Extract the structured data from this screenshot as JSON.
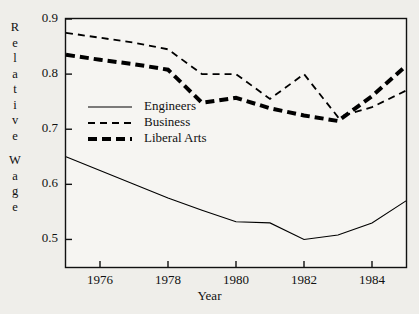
{
  "chart_data": {
    "type": "line",
    "title": "",
    "xlabel": "Year",
    "ylabel": "Relative Wage",
    "ylabel_letters": [
      "R",
      "e",
      "l",
      "a",
      "t",
      "i",
      "v",
      "e",
      "W",
      "a",
      "g",
      "e"
    ],
    "xlim": [
      1975,
      1985
    ],
    "ylim": [
      0.45,
      0.9
    ],
    "ytick_labels": [
      "0.9",
      "0.8",
      "0.7",
      "0.6",
      "0.5"
    ],
    "ytick_values": [
      0.9,
      0.8,
      0.7,
      0.6,
      0.5
    ],
    "xtick_labels": [
      "1976",
      "1978",
      "1980",
      "1982",
      "1984"
    ],
    "xtick_values": [
      1976,
      1978,
      1980,
      1982,
      1984
    ],
    "grid": false,
    "legend_position": "center-left",
    "x": [
      1975,
      1976,
      1977,
      1978,
      1979,
      1980,
      1981,
      1982,
      1983,
      1984,
      1985
    ],
    "series": [
      {
        "name": "Engineers",
        "style": "solid",
        "width": 1.1,
        "color": "#000000",
        "values": [
          0.65,
          0.625,
          0.6,
          0.575,
          0.553,
          0.532,
          0.53,
          0.5,
          0.508,
          0.53,
          0.57
        ]
      },
      {
        "name": "Business",
        "style": "dashed",
        "width": 1.8,
        "color": "#000000",
        "values": [
          0.875,
          0.866,
          0.857,
          0.845,
          0.8,
          0.8,
          0.755,
          0.8,
          0.722,
          0.74,
          0.77
        ]
      },
      {
        "name": "Liberal Arts",
        "style": "dashed",
        "width": 4.0,
        "color": "#000000",
        "values": [
          0.835,
          0.826,
          0.818,
          0.808,
          0.748,
          0.757,
          0.738,
          0.725,
          0.715,
          0.76,
          0.815
        ]
      }
    ]
  },
  "legend": {
    "items": [
      {
        "label": "Engineers"
      },
      {
        "label": "Business"
      },
      {
        "label": "Liberal Arts"
      }
    ]
  }
}
